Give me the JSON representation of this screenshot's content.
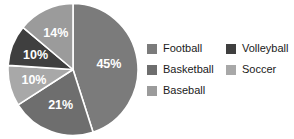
{
  "chart_data": {
    "type": "pie",
    "title": "",
    "categories": [
      "Football",
      "Basketball",
      "Soccer",
      "Volleyball",
      "Baseball"
    ],
    "values": [
      45,
      21,
      10,
      10,
      14
    ],
    "value_unit": "%",
    "start_angle_deg": 0,
    "direction": "clockwise",
    "legend_position": "right",
    "grid": false,
    "slices": [
      {
        "label": "Football",
        "value": 45,
        "display": "45%",
        "color": "#7b7b7b"
      },
      {
        "label": "Basketball",
        "value": 21,
        "display": "21%",
        "color": "#6e6e6e"
      },
      {
        "label": "Soccer",
        "value": 10,
        "display": "10%",
        "color": "#a8a8a8"
      },
      {
        "label": "Volleyball",
        "value": 10,
        "display": "10%",
        "color": "#3f3f3f"
      },
      {
        "label": "Baseball",
        "value": 14,
        "display": "14%",
        "color": "#9b9b9b"
      }
    ],
    "separator_color": "#ffffff",
    "label_color": "#ffffff"
  },
  "legend": {
    "columns": [
      {
        "items": [
          {
            "label": "Football",
            "color": "#7b7b7b"
          },
          {
            "label": "Basketball",
            "color": "#6e6e6e"
          },
          {
            "label": "Baseball",
            "color": "#9b9b9b"
          }
        ]
      },
      {
        "items": [
          {
            "label": "Volleyball",
            "color": "#3f3f3f"
          },
          {
            "label": "Soccer",
            "color": "#a8a8a8"
          }
        ]
      }
    ]
  }
}
